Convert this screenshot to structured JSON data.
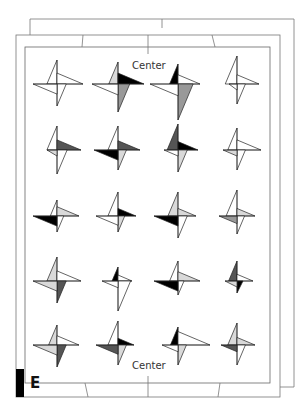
{
  "labels": {
    "top_center": "Center",
    "bottom_center": "Center",
    "corner_letter": "E"
  },
  "colors": {
    "frame_stroke": "#777777",
    "blade_white": "#ffffff",
    "blade_light": "#d9d9d9",
    "blade_mid": "#999999",
    "blade_dark": "#555555",
    "blade_black": "#000000",
    "corner_bar": "#000000"
  },
  "grid": {
    "columns_x": [
      57,
      118,
      178,
      237
    ],
    "rows_y": [
      84,
      150,
      216,
      281,
      345
    ]
  },
  "pinwheels": [
    {
      "row": 0,
      "col": 0,
      "arms": [
        24,
        26,
        22,
        24
      ],
      "fills": [
        "w",
        "w",
        "w",
        "w"
      ]
    },
    {
      "row": 0,
      "col": 1,
      "arms": [
        22,
        26,
        28,
        26
      ],
      "fills": [
        "l",
        "k",
        "m",
        "w"
      ]
    },
    {
      "row": 0,
      "col": 2,
      "arms": [
        20,
        22,
        36,
        28
      ],
      "fills": [
        "k",
        "w",
        "m",
        "w"
      ]
    },
    {
      "row": 0,
      "col": 3,
      "arms": [
        28,
        22,
        20,
        8
      ],
      "fills": [
        "w",
        "w",
        "w",
        "w"
      ]
    },
    {
      "row": 1,
      "col": 0,
      "arms": [
        24,
        24,
        24,
        10
      ],
      "fills": [
        "w",
        "d",
        "w",
        "l"
      ]
    },
    {
      "row": 1,
      "col": 1,
      "arms": [
        24,
        22,
        20,
        24
      ],
      "fills": [
        "w",
        "d",
        "l",
        "k"
      ]
    },
    {
      "row": 1,
      "col": 2,
      "arms": [
        26,
        20,
        22,
        14
      ],
      "fills": [
        "d",
        "k",
        "l",
        "w"
      ]
    },
    {
      "row": 1,
      "col": 3,
      "arms": [
        22,
        24,
        20,
        14
      ],
      "fills": [
        "w",
        "w",
        "w",
        "l"
      ]
    },
    {
      "row": 2,
      "col": 0,
      "arms": [
        16,
        22,
        16,
        24
      ],
      "fills": [
        "w",
        "l",
        "w",
        "k"
      ]
    },
    {
      "row": 2,
      "col": 1,
      "arms": [
        24,
        18,
        16,
        22
      ],
      "fills": [
        "w",
        "k",
        "l",
        "w"
      ]
    },
    {
      "row": 2,
      "col": 2,
      "arms": [
        24,
        18,
        22,
        24
      ],
      "fills": [
        "l",
        "l",
        "w",
        "k"
      ]
    },
    {
      "row": 2,
      "col": 3,
      "arms": [
        26,
        18,
        18,
        18
      ],
      "fills": [
        "w",
        "l",
        "w",
        "m"
      ]
    },
    {
      "row": 3,
      "col": 0,
      "arms": [
        24,
        24,
        22,
        24
      ],
      "fills": [
        "l",
        "w",
        "d",
        "l"
      ]
    },
    {
      "row": 3,
      "col": 1,
      "arms": [
        14,
        14,
        30,
        16
      ],
      "fills": [
        "k",
        "w",
        "w",
        "w"
      ]
    },
    {
      "row": 3,
      "col": 2,
      "arms": [
        20,
        22,
        14,
        24
      ],
      "fills": [
        "w",
        "l",
        "w",
        "k"
      ]
    },
    {
      "row": 3,
      "col": 3,
      "arms": [
        20,
        16,
        12,
        12
      ],
      "fills": [
        "d",
        "w",
        "k",
        "l"
      ]
    },
    {
      "row": 4,
      "col": 0,
      "arms": [
        20,
        22,
        22,
        24
      ],
      "fills": [
        "l",
        "w",
        "d",
        "l"
      ]
    },
    {
      "row": 4,
      "col": 1,
      "arms": [
        24,
        16,
        20,
        22
      ],
      "fills": [
        "w",
        "k",
        "l",
        "d"
      ]
    },
    {
      "row": 4,
      "col": 2,
      "arms": [
        18,
        32,
        20,
        16
      ],
      "fills": [
        "k",
        "w",
        "l",
        "w"
      ]
    },
    {
      "row": 4,
      "col": 3,
      "arms": [
        22,
        18,
        20,
        16
      ],
      "fills": [
        "l",
        "l",
        "w",
        "d"
      ]
    }
  ]
}
